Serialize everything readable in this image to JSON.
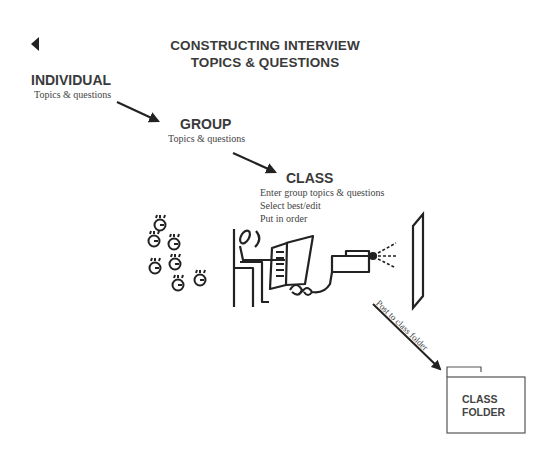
{
  "nav": {
    "back_icon": "triangle-left-icon"
  },
  "header": {
    "title_line1": "CONSTRUCTING INTERVIEW",
    "title_line2": "TOPICS & QUESTIONS"
  },
  "stages": [
    {
      "label": "INDIVIDUAL",
      "lines": [
        "Topics & questions"
      ]
    },
    {
      "label": "GROUP",
      "lines": [
        "Topics & questions"
      ]
    },
    {
      "label": "CLASS",
      "lines": [
        "Enter group topics & questions",
        "Select best/edit",
        "Put in order"
      ]
    }
  ],
  "illustration": {
    "people_icon": "group-of-people-icon",
    "computer_user_icon": "person-at-computer-icon",
    "projector_icon": "projector-icon",
    "screen_icon": "projection-screen-icon"
  },
  "post_arrow_label": "Post to class folder",
  "folder": {
    "line1": "CLASS",
    "line2": "FOLDER",
    "icon": "folder-icon"
  },
  "colors": {
    "ink": "#2a2a2a",
    "background": "#ffffff"
  }
}
